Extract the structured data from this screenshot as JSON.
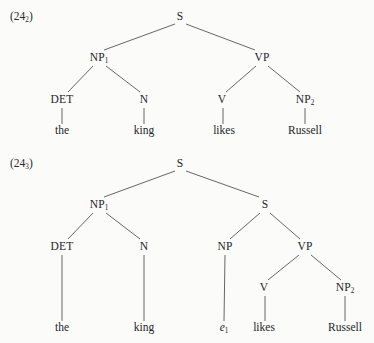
{
  "page": {
    "background_color": "#fbfbfa",
    "ink_color": "#24242a",
    "line_color": "#55555e"
  },
  "figures": [
    {
      "tag_prefix": "(24",
      "tag_sub": "2",
      "tag_suffix": ")",
      "tag_x": 10,
      "tag_y": 17,
      "nodes": [
        {
          "name": "node-s-root",
          "label": "S",
          "sub": "",
          "x": 180,
          "y": 17
        },
        {
          "name": "node-np1",
          "label": "NP",
          "sub": "1",
          "x": 99,
          "y": 58
        },
        {
          "name": "node-vp",
          "label": "VP",
          "sub": "",
          "x": 262,
          "y": 58
        },
        {
          "name": "node-det",
          "label": "DET",
          "sub": "",
          "x": 62,
          "y": 100
        },
        {
          "name": "node-n",
          "label": "N",
          "sub": "",
          "x": 144,
          "y": 100
        },
        {
          "name": "node-v",
          "label": "V",
          "sub": "",
          "x": 222,
          "y": 100
        },
        {
          "name": "node-np2",
          "label": "NP",
          "sub": "2",
          "x": 305,
          "y": 100
        }
      ],
      "terminals": [
        {
          "name": "terminal-the",
          "label": "the",
          "sub": "",
          "italic": false,
          "x": 62,
          "y": 131
        },
        {
          "name": "terminal-king",
          "label": "king",
          "sub": "",
          "italic": false,
          "x": 144,
          "y": 131
        },
        {
          "name": "terminal-likes",
          "label": "likes",
          "sub": "",
          "italic": false,
          "x": 224,
          "y": 131
        },
        {
          "name": "terminal-russell",
          "label": "Russell",
          "sub": "",
          "italic": false,
          "x": 305,
          "y": 131
        }
      ],
      "edges": [
        {
          "name": "edge-s-np1",
          "x1": 175,
          "y1": 24,
          "x2": 104,
          "y2": 50
        },
        {
          "name": "edge-s-vp",
          "x1": 186,
          "y1": 24,
          "x2": 255,
          "y2": 50
        },
        {
          "name": "edge-np1-det",
          "x1": 93,
          "y1": 66,
          "x2": 68,
          "y2": 92
        },
        {
          "name": "edge-np1-n",
          "x1": 106,
          "y1": 66,
          "x2": 140,
          "y2": 92
        },
        {
          "name": "edge-vp-v",
          "x1": 256,
          "y1": 66,
          "x2": 226,
          "y2": 92
        },
        {
          "name": "edge-vp-np2",
          "x1": 268,
          "y1": 66,
          "x2": 300,
          "y2": 92
        },
        {
          "name": "stem-det-the",
          "x1": 62,
          "y1": 108,
          "x2": 62,
          "y2": 124
        },
        {
          "name": "stem-n-king",
          "x1": 144,
          "y1": 108,
          "x2": 144,
          "y2": 124
        },
        {
          "name": "stem-v-likes",
          "x1": 223,
          "y1": 108,
          "x2": 223,
          "y2": 124
        },
        {
          "name": "stem-np2-russell",
          "x1": 305,
          "y1": 108,
          "x2": 305,
          "y2": 124
        }
      ]
    },
    {
      "tag_prefix": "(24",
      "tag_sub": "3",
      "tag_suffix": ")",
      "tag_x": 10,
      "tag_y": 164,
      "nodes": [
        {
          "name": "node-s-root",
          "label": "S",
          "sub": "",
          "x": 180,
          "y": 164
        },
        {
          "name": "node-np1",
          "label": "NP",
          "sub": "1",
          "x": 99,
          "y": 205
        },
        {
          "name": "node-s-embedded",
          "label": "S",
          "sub": "",
          "x": 265,
          "y": 205
        },
        {
          "name": "node-det",
          "label": "DET",
          "sub": "",
          "x": 62,
          "y": 247
        },
        {
          "name": "node-n",
          "label": "N",
          "sub": "",
          "x": 144,
          "y": 247
        },
        {
          "name": "node-np",
          "label": "NP",
          "sub": "",
          "x": 225,
          "y": 247
        },
        {
          "name": "node-vp",
          "label": "VP",
          "sub": "",
          "x": 305,
          "y": 247
        },
        {
          "name": "node-v",
          "label": "V",
          "sub": "",
          "x": 264,
          "y": 288
        },
        {
          "name": "node-np2",
          "label": "NP",
          "sub": "2",
          "x": 345,
          "y": 288
        }
      ],
      "terminals": [
        {
          "name": "terminal-the",
          "label": "the",
          "sub": "",
          "italic": false,
          "x": 62,
          "y": 328
        },
        {
          "name": "terminal-king",
          "label": "king",
          "sub": "",
          "italic": false,
          "x": 144,
          "y": 328
        },
        {
          "name": "terminal-trace",
          "label": "e",
          "sub": "1",
          "italic": true,
          "x": 224,
          "y": 328
        },
        {
          "name": "terminal-likes",
          "label": "likes",
          "sub": "",
          "italic": false,
          "x": 264,
          "y": 328
        },
        {
          "name": "terminal-russell",
          "label": "Russell",
          "sub": "",
          "italic": false,
          "x": 345,
          "y": 328
        }
      ],
      "edges": [
        {
          "name": "edge-s-np1",
          "x1": 175,
          "y1": 171,
          "x2": 104,
          "y2": 197
        },
        {
          "name": "edge-s-sembedded",
          "x1": 186,
          "y1": 171,
          "x2": 259,
          "y2": 197
        },
        {
          "name": "edge-np1-det",
          "x1": 93,
          "y1": 213,
          "x2": 68,
          "y2": 239
        },
        {
          "name": "edge-np1-n",
          "x1": 106,
          "y1": 213,
          "x2": 140,
          "y2": 239
        },
        {
          "name": "edge-sembedded-np",
          "x1": 260,
          "y1": 213,
          "x2": 230,
          "y2": 239
        },
        {
          "name": "edge-sembedded-vp",
          "x1": 270,
          "y1": 213,
          "x2": 300,
          "y2": 239
        },
        {
          "name": "edge-vp-v",
          "x1": 299,
          "y1": 255,
          "x2": 268,
          "y2": 280
        },
        {
          "name": "edge-vp-np2",
          "x1": 311,
          "y1": 255,
          "x2": 341,
          "y2": 280
        },
        {
          "name": "stem-det-the",
          "x1": 62,
          "y1": 255,
          "x2": 62,
          "y2": 321
        },
        {
          "name": "stem-n-king",
          "x1": 144,
          "y1": 255,
          "x2": 144,
          "y2": 321
        },
        {
          "name": "stem-np-trace",
          "x1": 225,
          "y1": 255,
          "x2": 224,
          "y2": 321
        },
        {
          "name": "stem-v-likes",
          "x1": 265,
          "y1": 296,
          "x2": 265,
          "y2": 321
        },
        {
          "name": "stem-np2-russell",
          "x1": 345,
          "y1": 296,
          "x2": 345,
          "y2": 321
        }
      ]
    }
  ]
}
